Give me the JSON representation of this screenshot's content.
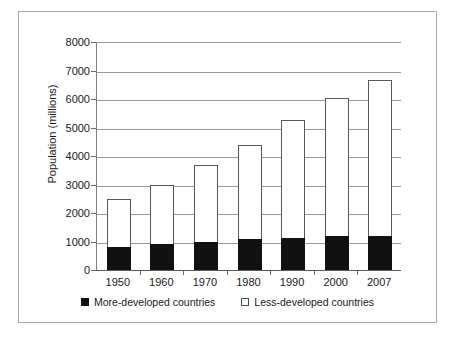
{
  "chart_data": {
    "type": "bar",
    "subtype": "stacked",
    "title": "",
    "xlabel": "",
    "ylabel": "Population (millions)",
    "categories": [
      "1950",
      "1960",
      "1970",
      "1980",
      "1990",
      "2000",
      "2007"
    ],
    "series": [
      {
        "name": "More-developed countries",
        "color": "#111111",
        "values": [
          800,
          900,
          1000,
          1080,
          1120,
          1180,
          1200
        ]
      },
      {
        "name": "Less-developed countries",
        "color": "#ffffff",
        "values": [
          1700,
          2100,
          2700,
          3320,
          4130,
          4870,
          5450
        ]
      }
    ],
    "totals": [
      2500,
      3000,
      3700,
      4400,
      5250,
      6050,
      6650
    ],
    "ylim": [
      0,
      8000
    ],
    "yticks": [
      0,
      1000,
      2000,
      3000,
      4000,
      5000,
      6000,
      7000,
      8000
    ],
    "ytick_labels": [
      "0",
      "1000",
      "2000",
      "3000",
      "4000",
      "5000",
      "6000",
      "7000",
      "8000"
    ],
    "grid": true,
    "grid_axis": "y",
    "legend_position": "bottom",
    "legend_entries": [
      {
        "label": "More-developed countries",
        "swatch": "filled"
      },
      {
        "label": "Less-developed countries",
        "swatch": "hollow"
      }
    ]
  }
}
